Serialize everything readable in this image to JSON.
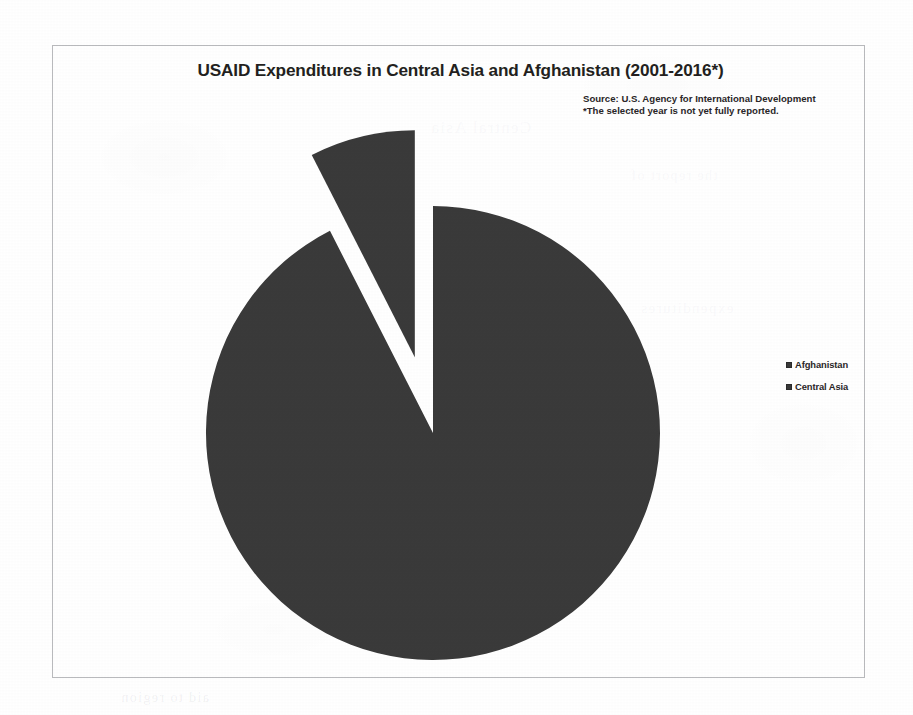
{
  "document": {
    "background_color": "#ffffff",
    "frame_border_color": "#b9babd"
  },
  "chart": {
    "title": "USAID Expenditures in Central Asia and Afghanistan (2001-2016*)",
    "source_line_1": "Source: U.S. Agency for International Development",
    "source_line_2": "*The selected year is not yet fully reported.",
    "slice_color": "#3a3a3a",
    "legend": {
      "position": "right",
      "items": [
        {
          "label": "Afghanistan",
          "color": "#3a3a3a"
        },
        {
          "label": "Central Asia",
          "color": "#3a3a3a"
        }
      ]
    }
  },
  "chart_data": {
    "type": "pie",
    "title": "USAID Expenditures in Central Asia and Afghanistan (2001-2016*)",
    "categories": [
      "Afghanistan",
      "Central Asia"
    ],
    "values": [
      92.5,
      7.5
    ],
    "unit": "percent",
    "colors": [
      "#3a3a3a",
      "#3a3a3a"
    ],
    "exploded": [
      "Central Asia"
    ],
    "legend_position": "right",
    "grid": false,
    "annotations": [
      "Source: U.S. Agency for International Development",
      "*The selected year is not yet fully reported."
    ]
  },
  "ghost_text": {
    "line_1": "Central Asia",
    "line_2": "the report of",
    "line_3": "expenditures",
    "line_4": "aid to region"
  }
}
